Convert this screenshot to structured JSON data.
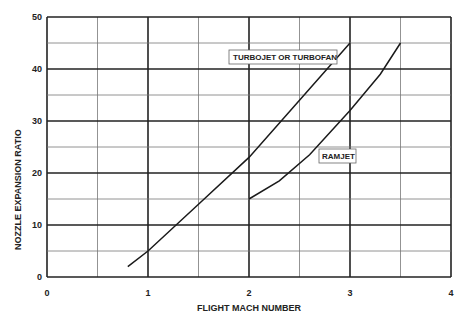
{
  "chart_data": {
    "type": "line",
    "title": "",
    "xlabel": "FLIGHT MACH NUMBER",
    "ylabel": "NOZZLE EXPANSION RATIO",
    "xlim": [
      0,
      4
    ],
    "ylim": [
      0,
      50
    ],
    "x_ticks": [
      "0",
      "1",
      "2",
      "3",
      "4"
    ],
    "y_ticks": [
      "0",
      "10",
      "20",
      "30",
      "40",
      "50"
    ],
    "grid": true,
    "legend_position": "inline labels",
    "series": [
      {
        "name": "TURBOJET OR TURBOFAN",
        "x": [
          0.8,
          1.0,
          1.5,
          2.0,
          2.5,
          3.0
        ],
        "y": [
          2,
          5,
          14,
          23,
          34,
          45
        ]
      },
      {
        "name": "RAMJET",
        "x": [
          2.0,
          2.3,
          2.6,
          3.0,
          3.3,
          3.5
        ],
        "y": [
          15,
          18.5,
          23.5,
          32,
          39,
          45
        ]
      }
    ]
  }
}
